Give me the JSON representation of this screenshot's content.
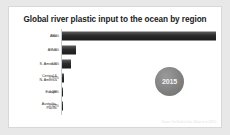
{
  "figure": {
    "title": "Global river plastic input to the ocean by region",
    "year_badge": "2015",
    "source_note": "Source: Our World in Data / Meijer et al. (2021)"
  },
  "chart_data": {
    "type": "bar",
    "orientation": "horizontal",
    "title": "Global river plastic input to the ocean by region",
    "xlabel": "",
    "ylabel": "",
    "categories": [
      "Asia",
      "Africa",
      "S. America",
      "Central &\nN. America",
      "Europe",
      "Australia-\nPacific"
    ],
    "values": [
      86.0,
      7.8,
      4.8,
      0.95,
      0.28,
      0.02
    ],
    "value_labels": [
      "86%",
      "7.8%",
      "4.8%",
      "0.95%",
      "0.28%",
      "0.02%"
    ],
    "xlim": [
      0,
      86
    ],
    "grid": false,
    "legend": false,
    "bar_color": "#2b2b2b",
    "annotations": [
      "2015"
    ]
  }
}
